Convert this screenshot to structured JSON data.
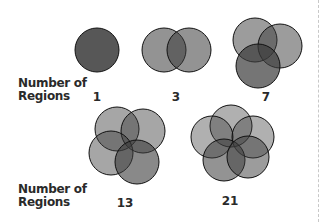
{
  "labels": {
    "row1_label_line1": "Number of",
    "row1_label_line2": "Regions",
    "row2_label_line1": "Number of",
    "row2_label_line2": "Regions"
  },
  "figures": [
    {
      "circles": 1,
      "regions": "1"
    },
    {
      "circles": 2,
      "regions": "3"
    },
    {
      "circles": 3,
      "regions": "7"
    },
    {
      "circles": 4,
      "regions": "13"
    },
    {
      "circles": 5,
      "regions": "21"
    }
  ],
  "colors": {
    "fill": "#4a4a4a",
    "stroke": "#111111",
    "background": "#ffffff",
    "text": "#2a2a2a"
  }
}
